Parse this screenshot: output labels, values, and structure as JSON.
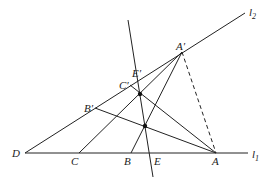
{
  "diagram": {
    "lines": {
      "l1": {
        "label": "l",
        "sub": "1"
      },
      "l2": {
        "label": "l",
        "sub": "2"
      }
    },
    "points": {
      "D": "D",
      "C": "C",
      "B": "B",
      "E": "E",
      "A": "A",
      "A_prime": "A′",
      "B_prime": "B′",
      "C_prime": "C′",
      "E_prime": "E′"
    },
    "colors": {
      "stroke": "#222222",
      "background": "#ffffff"
    }
  }
}
